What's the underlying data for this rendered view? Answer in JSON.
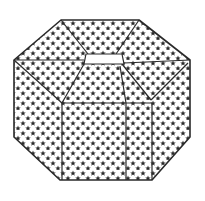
{
  "figure": {
    "title": "",
    "colors": {
      "background": "#ffffff",
      "paper": "#ffffff",
      "stroke": "#2a2a2a",
      "star": "#2a2a2a",
      "tab": "#ffffff"
    },
    "pattern": "stars",
    "outline": [
      [
        61,
        20
      ],
      [
        139,
        20
      ],
      [
        190,
        60
      ],
      [
        190,
        137
      ],
      [
        152,
        180
      ],
      [
        60,
        180
      ],
      [
        14,
        137
      ],
      [
        14,
        60
      ]
    ],
    "tab": [
      [
        86,
        54
      ],
      [
        122,
        54
      ],
      [
        124,
        64
      ],
      [
        84,
        64
      ]
    ],
    "creases": [
      {
        "name": "top-left-diagonal",
        "points": [
          [
            61,
            20
          ],
          [
            88,
            54
          ]
        ]
      },
      {
        "name": "top-right-diagonal",
        "points": [
          [
            139,
            20
          ],
          [
            116,
            54
          ]
        ]
      },
      {
        "name": "left-horizontal",
        "points": [
          [
            14,
            60
          ],
          [
            84,
            60
          ]
        ]
      },
      {
        "name": "right-horizontal",
        "points": [
          [
            124,
            63
          ],
          [
            190,
            60
          ]
        ]
      },
      {
        "name": "left-outer-diagonal",
        "points": [
          [
            14,
            60
          ],
          [
            62,
            103
          ]
        ]
      },
      {
        "name": "left-inner-diagonal",
        "points": [
          [
            84,
            64
          ],
          [
            62,
            103
          ]
        ]
      },
      {
        "name": "right-inner-diagonal",
        "points": [
          [
            122,
            64
          ],
          [
            151,
            100
          ]
        ]
      },
      {
        "name": "right-outer-diagonal",
        "points": [
          [
            188,
            63
          ],
          [
            151,
            100
          ]
        ]
      },
      {
        "name": "center-right-vertical",
        "points": [
          [
            120,
            66
          ],
          [
            126,
            103
          ]
        ]
      },
      {
        "name": "front-flap-left",
        "points": [
          [
            62,
            103
          ],
          [
            62,
            180
          ]
        ]
      },
      {
        "name": "front-flap-top",
        "points": [
          [
            62,
            103
          ],
          [
            152,
            103
          ]
        ]
      },
      {
        "name": "front-flap-divider",
        "points": [
          [
            126,
            103
          ],
          [
            126,
            180
          ]
        ]
      },
      {
        "name": "right-flap-edge",
        "points": [
          [
            152,
            103
          ],
          [
            152,
            180
          ]
        ]
      }
    ]
  }
}
